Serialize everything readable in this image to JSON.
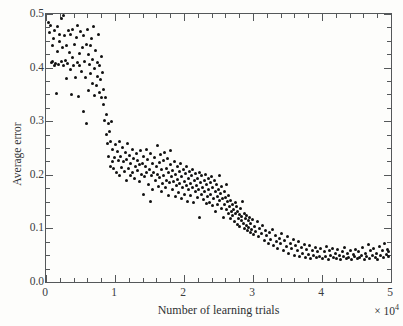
{
  "chart_data": {
    "type": "scatter",
    "title": "",
    "xlabel": "Number  of learning trials",
    "ylabel": "Average error",
    "x_multiplier_label": "× 10",
    "x_multiplier_exponent": "4",
    "xlim": [
      0,
      5
    ],
    "ylim": [
      0,
      0.5
    ],
    "x_major_ticks": [
      0,
      1,
      2,
      3,
      4,
      5
    ],
    "y_major_ticks": [
      0.0,
      0.1,
      0.2,
      0.3,
      0.4,
      0.5
    ],
    "x_tick_labels": [
      "0",
      "1",
      "2",
      "3",
      "4",
      "5"
    ],
    "y_tick_labels": [
      "0.0",
      "0.1",
      "0.2",
      "0.3",
      "0.4",
      "0.5"
    ],
    "x_minor_interval": 0.2,
    "y_minor_interval": 0.025,
    "grid": false,
    "legend": null,
    "marker_color": "#111111",
    "axis_color": "#55585a",
    "background_color": "#fdfdfb",
    "n_points": 322,
    "points": [
      [
        0.04,
        0.485
      ],
      [
        0.05,
        0.466
      ],
      [
        0.07,
        0.478
      ],
      [
        0.08,
        0.409
      ],
      [
        0.09,
        0.441
      ],
      [
        0.1,
        0.412
      ],
      [
        0.11,
        0.455
      ],
      [
        0.12,
        0.404
      ],
      [
        0.13,
        0.47
      ],
      [
        0.14,
        0.408
      ],
      [
        0.15,
        0.352
      ],
      [
        0.16,
        0.43
      ],
      [
        0.17,
        0.476
      ],
      [
        0.18,
        0.406
      ],
      [
        0.19,
        0.448
      ],
      [
        0.2,
        0.462
      ],
      [
        0.22,
        0.411
      ],
      [
        0.23,
        0.491
      ],
      [
        0.24,
        0.437
      ],
      [
        0.25,
        0.404
      ],
      [
        0.26,
        0.498
      ],
      [
        0.27,
        0.459
      ],
      [
        0.28,
        0.413
      ],
      [
        0.29,
        0.379
      ],
      [
        0.3,
        0.441
      ],
      [
        0.31,
        0.407
      ],
      [
        0.33,
        0.47
      ],
      [
        0.34,
        0.428
      ],
      [
        0.35,
        0.396
      ],
      [
        0.36,
        0.462
      ],
      [
        0.37,
        0.35
      ],
      [
        0.38,
        0.418
      ],
      [
        0.39,
        0.472
      ],
      [
        0.4,
        0.403
      ],
      [
        0.42,
        0.443
      ],
      [
        0.43,
        0.381
      ],
      [
        0.44,
        0.456
      ],
      [
        0.45,
        0.41
      ],
      [
        0.46,
        0.479
      ],
      [
        0.47,
        0.347
      ],
      [
        0.48,
        0.426
      ],
      [
        0.49,
        0.404
      ],
      [
        0.5,
        0.468
      ],
      [
        0.52,
        0.392
      ],
      [
        0.53,
        0.437
      ],
      [
        0.54,
        0.319
      ],
      [
        0.55,
        0.459
      ],
      [
        0.56,
        0.411
      ],
      [
        0.57,
        0.382
      ],
      [
        0.58,
        0.444
      ],
      [
        0.59,
        0.295
      ],
      [
        0.6,
        0.472
      ],
      [
        0.61,
        0.424
      ],
      [
        0.62,
        0.358
      ],
      [
        0.63,
        0.406
      ],
      [
        0.64,
        0.441
      ],
      [
        0.65,
        0.389
      ],
      [
        0.66,
        0.455
      ],
      [
        0.67,
        0.371
      ],
      [
        0.68,
        0.415
      ],
      [
        0.69,
        0.476
      ],
      [
        0.7,
        0.348
      ],
      [
        0.71,
        0.398
      ],
      [
        0.72,
        0.432
      ],
      [
        0.73,
        0.366
      ],
      [
        0.74,
        0.41
      ],
      [
        0.75,
        0.383
      ],
      [
        0.76,
        0.462
      ],
      [
        0.77,
        0.354
      ],
      [
        0.78,
        0.404
      ],
      [
        0.79,
        0.377
      ],
      [
        0.8,
        0.345
      ],
      [
        0.81,
        0.421
      ],
      [
        0.82,
        0.39
      ],
      [
        0.83,
        0.332
      ],
      [
        0.84,
        0.36
      ],
      [
        0.85,
        0.302
      ],
      [
        0.86,
        0.344
      ],
      [
        0.87,
        0.276
      ],
      [
        0.88,
        0.312
      ],
      [
        0.89,
        0.258
      ],
      [
        0.9,
        0.296
      ],
      [
        0.91,
        0.234
      ],
      [
        0.92,
        0.281
      ],
      [
        0.93,
        0.216
      ],
      [
        0.94,
        0.262
      ],
      [
        0.95,
        0.299
      ],
      [
        0.96,
        0.224
      ],
      [
        0.97,
        0.248
      ],
      [
        0.98,
        0.212
      ],
      [
        0.99,
        0.233
      ],
      [
        1.0,
        0.256
      ],
      [
        1.02,
        0.205
      ],
      [
        1.04,
        0.243
      ],
      [
        1.05,
        0.226
      ],
      [
        1.06,
        0.262
      ],
      [
        1.07,
        0.198
      ],
      [
        1.08,
        0.235
      ],
      [
        1.1,
        0.213
      ],
      [
        1.11,
        0.251
      ],
      [
        1.12,
        0.224
      ],
      [
        1.14,
        0.206
      ],
      [
        1.15,
        0.241
      ],
      [
        1.16,
        0.19
      ],
      [
        1.17,
        0.228
      ],
      [
        1.18,
        0.258
      ],
      [
        1.2,
        0.212
      ],
      [
        1.21,
        0.236
      ],
      [
        1.22,
        0.199
      ],
      [
        1.23,
        0.221
      ],
      [
        1.25,
        0.247
      ],
      [
        1.26,
        0.204
      ],
      [
        1.27,
        0.231
      ],
      [
        1.28,
        0.193
      ],
      [
        1.3,
        0.216
      ],
      [
        1.31,
        0.24
      ],
      [
        1.32,
        0.208
      ],
      [
        1.33,
        0.226
      ],
      [
        1.35,
        0.188
      ],
      [
        1.36,
        0.219
      ],
      [
        1.37,
        0.245
      ],
      [
        1.38,
        0.201
      ],
      [
        1.4,
        0.222
      ],
      [
        1.41,
        0.163
      ],
      [
        1.42,
        0.234
      ],
      [
        1.43,
        0.196
      ],
      [
        1.44,
        0.215
      ],
      [
        1.45,
        0.248
      ],
      [
        1.46,
        0.205
      ],
      [
        1.47,
        0.228
      ],
      [
        1.48,
        0.182
      ],
      [
        1.5,
        0.21
      ],
      [
        1.51,
        0.239
      ],
      [
        1.52,
        0.151
      ],
      [
        1.53,
        0.198
      ],
      [
        1.54,
        0.221
      ],
      [
        1.55,
        0.172
      ],
      [
        1.56,
        0.205
      ],
      [
        1.57,
        0.232
      ],
      [
        1.58,
        0.189
      ],
      [
        1.6,
        0.216
      ],
      [
        1.61,
        0.255
      ],
      [
        1.62,
        0.201
      ],
      [
        1.63,
        0.178
      ],
      [
        1.64,
        0.223
      ],
      [
        1.65,
        0.195
      ],
      [
        1.66,
        0.238
      ],
      [
        1.67,
        0.168
      ],
      [
        1.68,
        0.209
      ],
      [
        1.69,
        0.184
      ],
      [
        1.7,
        0.226
      ],
      [
        1.71,
        0.198
      ],
      [
        1.72,
        0.241
      ],
      [
        1.73,
        0.176
      ],
      [
        1.74,
        0.212
      ],
      [
        1.75,
        0.19
      ],
      [
        1.76,
        0.23
      ],
      [
        1.77,
        0.162
      ],
      [
        1.78,
        0.204
      ],
      [
        1.79,
        0.186
      ],
      [
        1.8,
        0.219
      ],
      [
        1.81,
        0.245
      ],
      [
        1.82,
        0.196
      ],
      [
        1.83,
        0.172
      ],
      [
        1.84,
        0.208
      ],
      [
        1.85,
        0.188
      ],
      [
        1.86,
        0.224
      ],
      [
        1.87,
        0.159
      ],
      [
        1.88,
        0.201
      ],
      [
        1.89,
        0.18
      ],
      [
        1.9,
        0.215
      ],
      [
        1.91,
        0.192
      ],
      [
        1.92,
        0.167
      ],
      [
        1.93,
        0.206
      ],
      [
        1.94,
        0.184
      ],
      [
        1.95,
        0.221
      ],
      [
        1.96,
        0.155
      ],
      [
        1.97,
        0.197
      ],
      [
        1.98,
        0.176
      ],
      [
        1.99,
        0.21
      ],
      [
        2.0,
        0.188
      ],
      [
        2.01,
        0.164
      ],
      [
        2.02,
        0.202
      ],
      [
        2.03,
        0.18
      ],
      [
        2.04,
        0.215
      ],
      [
        2.05,
        0.151
      ],
      [
        2.06,
        0.193
      ],
      [
        2.07,
        0.172
      ],
      [
        2.08,
        0.206
      ],
      [
        2.09,
        0.184
      ],
      [
        2.1,
        0.161
      ],
      [
        2.11,
        0.198
      ],
      [
        2.12,
        0.176
      ],
      [
        2.13,
        0.21
      ],
      [
        2.14,
        0.148
      ],
      [
        2.15,
        0.189
      ],
      [
        2.16,
        0.168
      ],
      [
        2.17,
        0.202
      ],
      [
        2.18,
        0.18
      ],
      [
        2.19,
        0.157
      ],
      [
        2.2,
        0.194
      ],
      [
        2.21,
        0.172
      ],
      [
        2.22,
        0.205
      ],
      [
        2.23,
        0.12
      ],
      [
        2.24,
        0.185
      ],
      [
        2.25,
        0.164
      ],
      [
        2.26,
        0.198
      ],
      [
        2.27,
        0.176
      ],
      [
        2.28,
        0.153
      ],
      [
        2.29,
        0.19
      ],
      [
        2.3,
        0.168
      ],
      [
        2.31,
        0.201
      ],
      [
        2.32,
        0.146
      ],
      [
        2.33,
        0.181
      ],
      [
        2.34,
        0.16
      ],
      [
        2.35,
        0.194
      ],
      [
        2.36,
        0.172
      ],
      [
        2.37,
        0.149
      ],
      [
        2.38,
        0.186
      ],
      [
        2.39,
        0.164
      ],
      [
        2.4,
        0.197
      ],
      [
        2.41,
        0.142
      ],
      [
        2.42,
        0.177
      ],
      [
        2.43,
        0.156
      ],
      [
        2.44,
        0.19
      ],
      [
        2.45,
        0.168
      ],
      [
        2.46,
        0.131
      ],
      [
        2.47,
        0.182
      ],
      [
        2.48,
        0.16
      ],
      [
        2.49,
        0.145
      ],
      [
        2.5,
        0.173
      ],
      [
        2.51,
        0.198
      ],
      [
        2.52,
        0.152
      ],
      [
        2.53,
        0.166
      ],
      [
        2.54,
        0.138
      ],
      [
        2.55,
        0.178
      ],
      [
        2.56,
        0.156
      ],
      [
        2.57,
        0.12
      ],
      [
        2.58,
        0.168
      ],
      [
        2.59,
        0.144
      ],
      [
        2.6,
        0.158
      ],
      [
        2.61,
        0.182
      ],
      [
        2.62,
        0.136
      ],
      [
        2.63,
        0.15
      ],
      [
        2.64,
        0.128
      ],
      [
        2.65,
        0.162
      ],
      [
        2.66,
        0.14
      ],
      [
        2.67,
        0.118
      ],
      [
        2.68,
        0.152
      ],
      [
        2.69,
        0.132
      ],
      [
        2.7,
        0.144
      ],
      [
        2.71,
        0.124
      ],
      [
        2.72,
        0.136
      ],
      [
        2.73,
        0.112
      ],
      [
        2.74,
        0.148
      ],
      [
        2.75,
        0.128
      ],
      [
        2.76,
        0.14
      ],
      [
        2.77,
        0.108
      ],
      [
        2.78,
        0.132
      ],
      [
        2.79,
        0.118
      ],
      [
        2.8,
        0.126
      ],
      [
        2.81,
        0.104
      ],
      [
        2.82,
        0.138
      ],
      [
        2.83,
        0.114
      ],
      [
        2.84,
        0.122
      ],
      [
        2.85,
        0.15
      ],
      [
        2.86,
        0.11
      ],
      [
        2.87,
        0.128
      ],
      [
        2.88,
        0.1
      ],
      [
        2.89,
        0.118
      ],
      [
        2.9,
        0.106
      ],
      [
        2.91,
        0.124
      ],
      [
        2.92,
        0.096
      ],
      [
        2.93,
        0.114
      ],
      [
        2.94,
        0.102
      ],
      [
        2.95,
        0.12
      ],
      [
        2.96,
        0.092
      ],
      [
        2.97,
        0.11
      ],
      [
        2.98,
        0.098
      ],
      [
        2.99,
        0.116
      ],
      [
        3.0,
        0.088
      ],
      [
        3.02,
        0.104
      ],
      [
        3.04,
        0.094
      ],
      [
        3.06,
        0.112
      ],
      [
        3.08,
        0.084
      ],
      [
        3.1,
        0.1
      ],
      [
        3.12,
        0.09
      ],
      [
        3.14,
        0.106
      ],
      [
        3.16,
        0.078
      ],
      [
        3.18,
        0.096
      ],
      [
        3.2,
        0.086
      ],
      [
        3.22,
        0.072
      ],
      [
        3.24,
        0.092
      ],
      [
        3.26,
        0.08
      ],
      [
        3.28,
        0.098
      ],
      [
        3.3,
        0.068
      ],
      [
        3.32,
        0.086
      ],
      [
        3.34,
        0.076
      ],
      [
        3.36,
        0.062
      ],
      [
        3.38,
        0.082
      ],
      [
        3.4,
        0.072
      ],
      [
        3.42,
        0.09
      ],
      [
        3.44,
        0.058
      ],
      [
        3.46,
        0.078
      ],
      [
        3.48,
        0.066
      ],
      [
        3.5,
        0.084
      ],
      [
        3.52,
        0.054
      ],
      [
        3.54,
        0.072
      ],
      [
        3.56,
        0.062
      ],
      [
        3.58,
        0.08
      ],
      [
        3.6,
        0.05
      ],
      [
        3.62,
        0.068
      ],
      [
        3.64,
        0.058
      ],
      [
        3.66,
        0.076
      ],
      [
        3.68,
        0.048
      ],
      [
        3.7,
        0.064
      ],
      [
        3.72,
        0.054
      ],
      [
        3.74,
        0.07
      ],
      [
        3.76,
        0.046
      ],
      [
        3.78,
        0.06
      ],
      [
        3.8,
        0.052
      ],
      [
        3.82,
        0.068
      ],
      [
        3.84,
        0.044
      ],
      [
        3.86,
        0.058
      ],
      [
        3.88,
        0.05
      ],
      [
        3.9,
        0.064
      ],
      [
        3.92,
        0.046
      ],
      [
        3.94,
        0.056
      ],
      [
        3.96,
        0.048
      ],
      [
        3.98,
        0.062
      ],
      [
        4.0,
        0.044
      ],
      [
        4.03,
        0.056
      ],
      [
        4.05,
        0.048
      ],
      [
        4.07,
        0.066
      ],
      [
        4.09,
        0.042
      ],
      [
        4.11,
        0.058
      ],
      [
        4.13,
        0.05
      ],
      [
        4.15,
        0.062
      ],
      [
        4.17,
        0.046
      ],
      [
        4.19,
        0.054
      ],
      [
        4.21,
        0.044
      ],
      [
        4.23,
        0.06
      ],
      [
        4.25,
        0.05
      ],
      [
        4.27,
        0.042
      ],
      [
        4.29,
        0.056
      ],
      [
        4.31,
        0.048
      ],
      [
        4.33,
        0.064
      ],
      [
        4.35,
        0.044
      ],
      [
        4.37,
        0.054
      ],
      [
        4.39,
        0.046
      ],
      [
        4.41,
        0.058
      ],
      [
        4.43,
        0.042
      ],
      [
        4.45,
        0.052
      ],
      [
        4.47,
        0.048
      ],
      [
        4.49,
        0.06
      ],
      [
        4.51,
        0.044
      ],
      [
        4.53,
        0.056
      ],
      [
        4.55,
        0.046
      ],
      [
        4.57,
        0.05
      ],
      [
        4.59,
        0.064
      ],
      [
        4.61,
        0.042
      ],
      [
        4.63,
        0.054
      ],
      [
        4.65,
        0.048
      ],
      [
        4.67,
        0.07
      ],
      [
        4.69,
        0.044
      ],
      [
        4.71,
        0.058
      ],
      [
        4.73,
        0.05
      ],
      [
        4.75,
        0.062
      ],
      [
        4.77,
        0.046
      ],
      [
        4.79,
        0.054
      ],
      [
        4.81,
        0.042
      ],
      [
        4.83,
        0.066
      ],
      [
        4.85,
        0.05
      ],
      [
        4.87,
        0.058
      ],
      [
        4.89,
        0.046
      ],
      [
        4.91,
        0.072
      ],
      [
        4.93,
        0.052
      ],
      [
        4.95,
        0.06
      ],
      [
        4.96,
        0.048
      ],
      [
        4.97,
        0.056
      ]
    ]
  }
}
